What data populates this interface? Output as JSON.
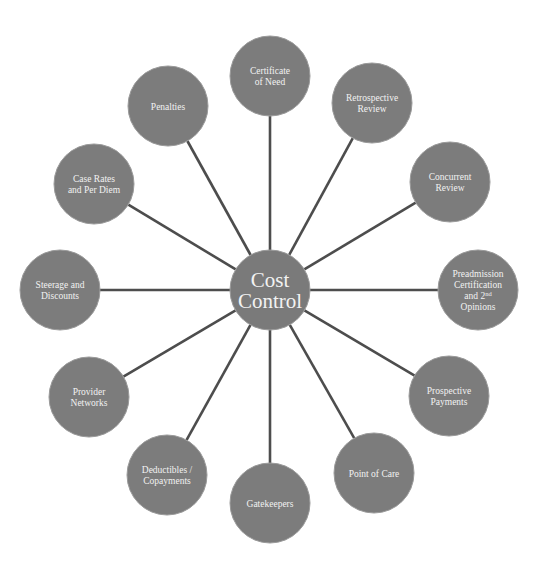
{
  "diagram": {
    "type": "hub-and-spoke",
    "center": {
      "label_lines": [
        "Cost",
        "Control"
      ],
      "x": 270,
      "y": 290,
      "r": 40
    },
    "colors": {
      "node_fill": "#7c7c7c",
      "spoke": "#4d4d4d",
      "text": "#f2f2f2",
      "background": "#ffffff"
    },
    "nodes": [
      {
        "id": "certificate-of-need",
        "label_lines": [
          "Certificate",
          "of Need"
        ],
        "x": 270,
        "y": 76,
        "r": 40
      },
      {
        "id": "retrospective-review",
        "label_lines": [
          "Retrospective",
          "Review"
        ],
        "x": 372,
        "y": 103,
        "r": 40
      },
      {
        "id": "concurrent-review",
        "label_lines": [
          "Concurrent",
          "Review"
        ],
        "x": 450,
        "y": 182,
        "r": 40
      },
      {
        "id": "preadmission-certification",
        "label_lines": [
          "Preadmission",
          "Certification",
          "and 2nd",
          "Opinions"
        ],
        "x": 478,
        "y": 290,
        "r": 40
      },
      {
        "id": "prospective-payments",
        "label_lines": [
          "Prospective",
          "Payments"
        ],
        "x": 449,
        "y": 396,
        "r": 40
      },
      {
        "id": "point-of-care",
        "label_lines": [
          "Point of Care"
        ],
        "x": 374,
        "y": 473,
        "r": 40
      },
      {
        "id": "gatekeepers",
        "label_lines": [
          "Gatekeepers"
        ],
        "x": 270,
        "y": 503,
        "r": 40
      },
      {
        "id": "deductibles-copayments",
        "label_lines": [
          "Deductibles /",
          "Copayments"
        ],
        "x": 167,
        "y": 475,
        "r": 40
      },
      {
        "id": "provider-networks",
        "label_lines": [
          "Provider",
          "Networks"
        ],
        "x": 89,
        "y": 397,
        "r": 40
      },
      {
        "id": "steerage-and-discounts",
        "label_lines": [
          "Steerage and",
          "Discounts"
        ],
        "x": 60,
        "y": 290,
        "r": 40
      },
      {
        "id": "case-rates-per-diem",
        "label_lines": [
          "Case Rates",
          "and Per Diem"
        ],
        "x": 94,
        "y": 184,
        "r": 40
      },
      {
        "id": "penalties",
        "label_lines": [
          "Penalties"
        ],
        "x": 168,
        "y": 106,
        "r": 40
      }
    ]
  }
}
